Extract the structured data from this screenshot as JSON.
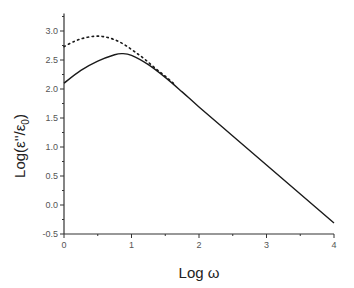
{
  "chart_data": {
    "type": "line",
    "title": "",
    "xlabel": "Log ω",
    "ylabel": "Log(ε''/ε0)",
    "xlim": [
      0,
      4
    ],
    "ylim": [
      -0.5,
      3.3
    ],
    "x_ticks": [
      "0",
      "1",
      "2",
      "3",
      "4"
    ],
    "y_ticks": [
      "-0.5",
      "0.0",
      "0.5",
      "1.0",
      "1.5",
      "2.0",
      "2.5",
      "3.0"
    ],
    "grid": false,
    "legend": null,
    "series": [
      {
        "name": "solid",
        "style": "solid",
        "color": "#1a1a1a",
        "x": [
          0,
          0.25,
          0.5,
          0.75,
          0.86,
          1.0,
          1.25,
          1.5,
          1.75,
          2.0,
          2.5,
          3.0,
          3.5,
          4.0
        ],
        "y": [
          2.1,
          2.32,
          2.48,
          2.59,
          2.61,
          2.58,
          2.42,
          2.2,
          1.95,
          1.69,
          1.19,
          0.69,
          0.19,
          -0.31
        ]
      },
      {
        "name": "dotted",
        "style": "dotted",
        "color": "#1a1a1a",
        "x": [
          0,
          0.15,
          0.3,
          0.46,
          0.6,
          0.75,
          0.9,
          1.05,
          1.2,
          1.35,
          1.5,
          1.65
        ],
        "y": [
          2.73,
          2.82,
          2.88,
          2.91,
          2.9,
          2.85,
          2.76,
          2.64,
          2.51,
          2.36,
          2.22,
          2.07
        ]
      }
    ]
  }
}
